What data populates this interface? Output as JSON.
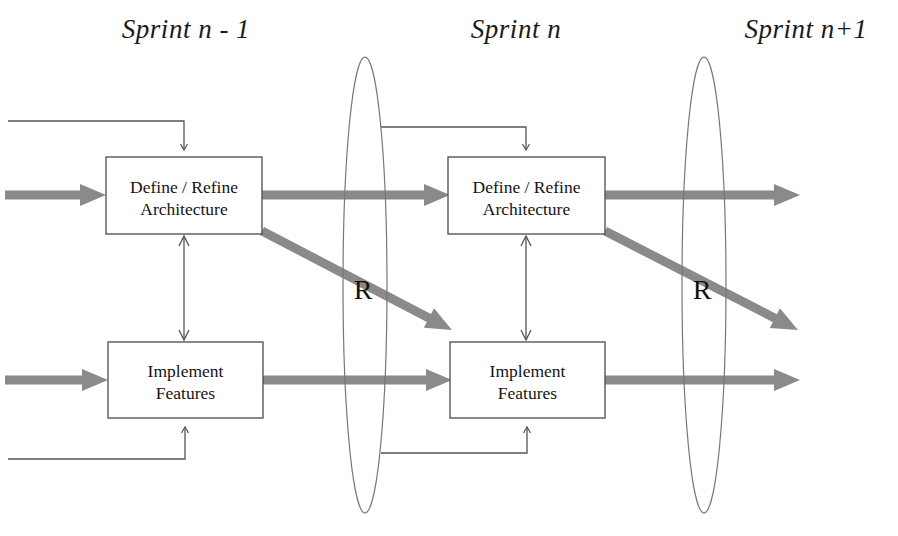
{
  "diagram": {
    "colors": {
      "flow_arrow": "#8a8a8a",
      "box_stroke": "#4a4a4a",
      "thin_line": "#555555",
      "ellipse_stroke": "#777777",
      "text": "#141414",
      "background": "#ffffff"
    }
  },
  "sprint_labels": [
    {
      "id": "sprint-n-minus-1",
      "text": "Sprint n - 1",
      "x": 186,
      "y": 14
    },
    {
      "id": "sprint-n",
      "text": "Sprint n",
      "x": 516,
      "y": 14
    },
    {
      "id": "sprint-n-plus-1",
      "text": "Sprint n+1",
      "x": 806,
      "y": 14
    }
  ],
  "boxes": [
    {
      "id": "define-refine-architecture-sprint-n-minus-1",
      "line1": "Define / Refine",
      "line2": "Architecture",
      "x": 106,
      "y": 157,
      "w": 156,
      "h": 77
    },
    {
      "id": "implement-features-sprint-n-minus-1",
      "line1": "Implement",
      "line2": "Features",
      "x": 108,
      "y": 342,
      "w": 155,
      "h": 76
    },
    {
      "id": "define-refine-architecture-sprint-n",
      "line1": "Define / Refine",
      "line2": "Architecture",
      "x": 448,
      "y": 157,
      "w": 157,
      "h": 77
    },
    {
      "id": "implement-features-sprint-n",
      "line1": "Implement",
      "line2": "Features",
      "x": 450,
      "y": 342,
      "w": 155,
      "h": 76
    }
  ],
  "release_markers": [
    {
      "id": "release-marker-left",
      "label": "R",
      "cx": 365,
      "cy": 285,
      "rx": 22,
      "ry": 228,
      "label_x": 363,
      "label_y": 290
    },
    {
      "id": "release-marker-right",
      "label": "R",
      "cx": 704,
      "cy": 285,
      "rx": 22,
      "ry": 228,
      "label_x": 702,
      "label_y": 290
    }
  ],
  "flow_arrows": [
    {
      "id": "inflow-architecture",
      "type": "horizontal",
      "x1": 5,
      "y1": 195,
      "x2": 106
    },
    {
      "id": "architecture-to-next-sprint",
      "type": "horizontal",
      "x1": 262,
      "y1": 195,
      "x2": 450
    },
    {
      "id": "architecture-out-right",
      "type": "horizontal",
      "x1": 605,
      "y1": 195,
      "x2": 800
    },
    {
      "id": "inflow-implement",
      "type": "horizontal",
      "x1": 5,
      "y1": 380,
      "x2": 108
    },
    {
      "id": "implement-to-next-sprint",
      "type": "horizontal",
      "x1": 263,
      "y1": 380,
      "x2": 452
    },
    {
      "id": "implement-out-right",
      "type": "horizontal",
      "x1": 605,
      "y1": 380,
      "x2": 800
    },
    {
      "id": "architecture-to-implement-diagonal",
      "type": "diagonal",
      "x1": 262,
      "y1": 231,
      "x2": 452,
      "y2": 330
    },
    {
      "id": "architecture-to-implement-diagonal-right",
      "type": "diagonal",
      "x1": 605,
      "y1": 231,
      "x2": 798,
      "y2": 330
    }
  ],
  "feedback_lines": [
    {
      "id": "feedback-top-left",
      "path": "M 8 121 L 184 121 L 184 150"
    },
    {
      "id": "feedback-bottom-left",
      "path": "M 8 459 L 185 459 L 185 427"
    },
    {
      "id": "feedback-top-right",
      "path": "M 381 127 L 526 127 L 526 150"
    },
    {
      "id": "feedback-bottom-right",
      "path": "M 381 453 L 527 453 L 527 427"
    }
  ],
  "sync_arrows": [
    {
      "id": "sync-arrow-sprint-n-minus-1",
      "x": 184,
      "y_top": 236,
      "y_bottom": 340
    },
    {
      "id": "sync-arrow-sprint-n",
      "x": 526,
      "y_top": 236,
      "y_bottom": 340
    }
  ]
}
